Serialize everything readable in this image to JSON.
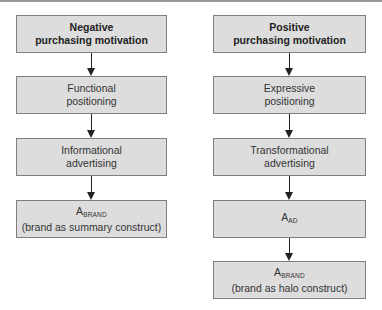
{
  "diagram": {
    "columns": [
      {
        "id": "negative",
        "boxes": [
          {
            "line1": "Negative",
            "line2": "purchasing motivation",
            "bold": true
          },
          {
            "line1": "Functional",
            "line2": "positioning"
          },
          {
            "line1": "Informational",
            "line2": "advertising"
          },
          {
            "main": "A",
            "subscript": "BRAND",
            "line2": "(brand as summary construct)"
          }
        ]
      },
      {
        "id": "positive",
        "boxes": [
          {
            "line1": "Positive",
            "line2": "purchasing motivation",
            "bold": true
          },
          {
            "line1": "Expressive",
            "line2": "positioning"
          },
          {
            "line1": "Transformational",
            "line2": "advertising"
          },
          {
            "main": "A",
            "subscript": "AD"
          },
          {
            "main": "A",
            "subscript": "BRAND",
            "line2": "(brand as halo construct)"
          }
        ]
      }
    ],
    "colors": {
      "box_fill": "#dddddd",
      "box_border": "#7f7f7f",
      "arrow": "#222222",
      "top_rule": "#9a9a9a"
    }
  }
}
